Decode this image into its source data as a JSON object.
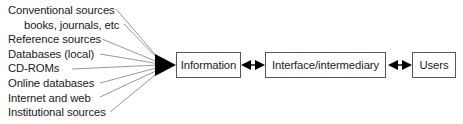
{
  "diagram": {
    "type": "flow-diagram",
    "sources": {
      "label": "information sources",
      "items": [
        {
          "text": "Conventional sources",
          "indented": false
        },
        {
          "text": "books, journals, etc",
          "indented": true
        },
        {
          "text": "Reference sources",
          "indented": false
        },
        {
          "text": "Databases (local)",
          "indented": false
        },
        {
          "text": "CD-ROMs",
          "indented": false
        },
        {
          "text": "Online databases",
          "indented": false
        },
        {
          "text": "Internet and web",
          "indented": false
        },
        {
          "text": "Institutional sources",
          "indented": false
        }
      ]
    },
    "nodes": [
      {
        "id": "information",
        "label": "Information"
      },
      {
        "id": "interface",
        "label": "Interface/intermediary"
      },
      {
        "id": "users",
        "label": "Users"
      }
    ],
    "connectors": [
      {
        "from": "sources",
        "to": "information",
        "style": "converging-fan",
        "arrowheads": "single-filled-triangle"
      },
      {
        "from": "information",
        "to": "interface",
        "style": "straight",
        "arrowheads": "double"
      },
      {
        "from": "interface",
        "to": "users",
        "style": "straight",
        "arrowheads": "double"
      }
    ],
    "colors": {
      "background": "#ffffff",
      "text": "#1a1a1a",
      "box_border": "#58585a",
      "connector_line": "#8c8c8e",
      "arrowhead": "#000000"
    }
  }
}
